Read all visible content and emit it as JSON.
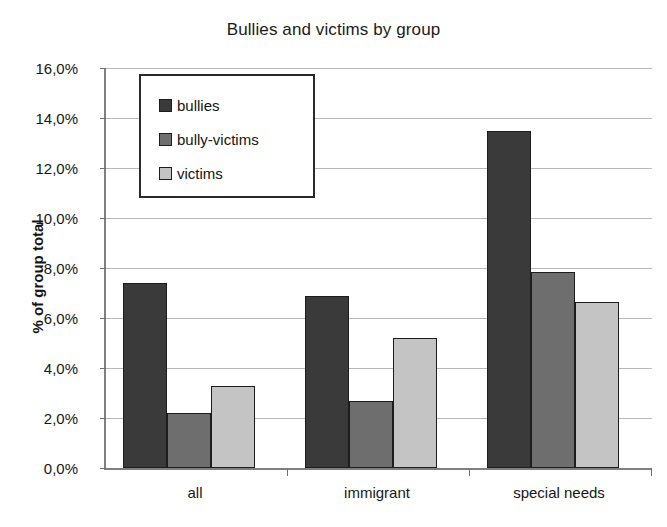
{
  "chart_data": {
    "type": "bar",
    "title": "Bullies and victims by group",
    "xlabel": "",
    "ylabel": "% of group total",
    "categories": [
      "all",
      "immigrant",
      "special needs"
    ],
    "series": [
      {
        "name": "bullies",
        "color": "#3a3a3a",
        "values": [
          7.4,
          6.9,
          13.5
        ]
      },
      {
        "name": "bully-victims",
        "color": "#6e6e6e",
        "values": [
          2.2,
          2.7,
          7.85
        ]
      },
      {
        "name": "victims",
        "color": "#c4c4c4",
        "values": [
          3.3,
          5.2,
          6.65
        ]
      }
    ],
    "ylim": [
      0,
      16
    ],
    "ytick_step": 2,
    "ytick_labels": [
      "0,0%",
      "2,0%",
      "4,0%",
      "6,0%",
      "8,0%",
      "10,0%",
      "12,0%",
      "14,0%",
      "16,0%"
    ],
    "ytick_values": [
      0,
      2,
      4,
      6,
      8,
      10,
      12,
      14,
      16
    ],
    "grid": true,
    "legend_position": "top-left-inside",
    "value_suffix": "%",
    "decimal_separator": ","
  }
}
